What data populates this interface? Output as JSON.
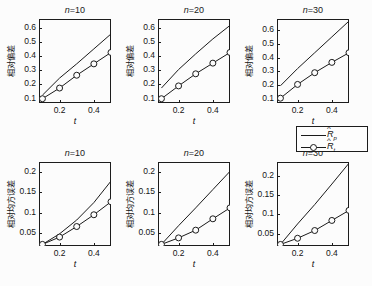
{
  "figure": {
    "background": "#fcfcfc",
    "axis_color": "#1c1c1c",
    "line_color": "#1a1a1a"
  },
  "legend": {
    "position": "below-top-right-panel",
    "entries": [
      {
        "label_base": "R",
        "label_sub": "p",
        "style": "solid-line",
        "marker": "none"
      },
      {
        "label_base": "R",
        "label_sub": "t",
        "style": "solid-line",
        "marker": "circle"
      }
    ]
  },
  "chart_data": [
    {
      "type": "line",
      "id": "panel-bias-n10",
      "title": "n=10",
      "title_prefix": "n",
      "title_value": "=10",
      "xlabel": "t",
      "ylabel": "相对偏差",
      "xlim": [
        0.08,
        0.5
      ],
      "ylim": [
        0.07,
        0.66
      ],
      "xticks": [
        0.2,
        0.4
      ],
      "xticklabels": [
        "0.2",
        "0.4"
      ],
      "yticks": [
        0.1,
        0.2,
        0.3,
        0.4,
        0.5,
        0.6
      ],
      "yticklabels": [
        "0.1",
        "0.2",
        "0.3",
        "0.4",
        "0.5",
        "0.6"
      ],
      "grid": false,
      "x": [
        0.1,
        0.2,
        0.3,
        0.4,
        0.5
      ],
      "series": [
        {
          "name": "R_p",
          "marker": "none",
          "values": [
            0.125,
            0.245,
            0.345,
            0.45,
            0.555
          ]
        },
        {
          "name": "R_t",
          "marker": "circle",
          "values": [
            0.1,
            0.175,
            0.265,
            0.345,
            0.425
          ]
        }
      ]
    },
    {
      "type": "line",
      "id": "panel-bias-n20",
      "title": "n=20",
      "title_prefix": "n",
      "title_value": "=20",
      "xlabel": "t",
      "ylabel": "相对偏差",
      "xlim": [
        0.08,
        0.5
      ],
      "ylim": [
        0.07,
        0.66
      ],
      "xticks": [
        0.2,
        0.4
      ],
      "xticklabels": [
        "0.2",
        "0.4"
      ],
      "yticks": [
        0.1,
        0.2,
        0.3,
        0.4,
        0.5,
        0.6
      ],
      "yticklabels": [
        "0.1",
        "0.2",
        "0.3",
        "0.4",
        "0.5",
        "0.6"
      ],
      "grid": false,
      "x": [
        0.1,
        0.2,
        0.3,
        0.4,
        0.5
      ],
      "series": [
        {
          "name": "R_p",
          "marker": "none",
          "values": [
            0.175,
            0.305,
            0.415,
            0.52,
            0.615
          ]
        },
        {
          "name": "R_t",
          "marker": "circle",
          "values": [
            0.1,
            0.19,
            0.275,
            0.35,
            0.425
          ]
        }
      ]
    },
    {
      "type": "line",
      "id": "panel-bias-n30",
      "title": "n=30",
      "title_prefix": "n",
      "title_value": "=30",
      "xlabel": "t",
      "ylabel": "相对偏差",
      "xlim": [
        0.08,
        0.5
      ],
      "ylim": [
        0.07,
        0.68
      ],
      "xticks": [
        0.2,
        0.4
      ],
      "xticklabels": [
        "0.2",
        "0.4"
      ],
      "yticks": [
        0.1,
        0.2,
        0.3,
        0.4,
        0.5,
        0.6
      ],
      "yticklabels": [
        "0.1",
        "0.2",
        "0.3",
        "0.4",
        "0.5",
        "0.6"
      ],
      "grid": false,
      "x": [
        0.1,
        0.2,
        0.3,
        0.4,
        0.5
      ],
      "series": [
        {
          "name": "R_p",
          "marker": "none",
          "values": [
            0.195,
            0.32,
            0.435,
            0.55,
            0.665
          ]
        },
        {
          "name": "R_t",
          "marker": "circle",
          "values": [
            0.105,
            0.205,
            0.29,
            0.365,
            0.435
          ]
        }
      ]
    },
    {
      "type": "line",
      "id": "panel-mse-n10",
      "title": "n=10",
      "title_prefix": "n",
      "title_value": "=10",
      "xlabel": "t",
      "ylabel": "相对均方误差",
      "xlim": [
        0.08,
        0.5
      ],
      "ylim": [
        0.018,
        0.225
      ],
      "xticks": [
        0.2,
        0.4
      ],
      "xticklabels": [
        "0.2",
        "0.4"
      ],
      "yticks": [
        0.05,
        0.1,
        0.15,
        0.2
      ],
      "yticklabels": [
        "0.05",
        "0.1",
        "0.15",
        "0.2"
      ],
      "grid": false,
      "x": [
        0.1,
        0.2,
        0.3,
        0.4,
        0.5
      ],
      "series": [
        {
          "name": "R_p",
          "marker": "none",
          "values": [
            0.022,
            0.048,
            0.082,
            0.125,
            0.178
          ]
        },
        {
          "name": "R_t",
          "marker": "circle",
          "values": [
            0.022,
            0.04,
            0.066,
            0.095,
            0.127
          ]
        }
      ]
    },
    {
      "type": "line",
      "id": "panel-mse-n20",
      "title": "n=20",
      "title_prefix": "n",
      "title_value": "=20",
      "xlabel": "t",
      "ylabel": "相对均方误差",
      "xlim": [
        0.08,
        0.5
      ],
      "ylim": [
        0.018,
        0.225
      ],
      "xticks": [
        0.2,
        0.4
      ],
      "xticklabels": [
        "0.2",
        "0.4"
      ],
      "yticks": [
        0.05,
        0.1,
        0.15,
        0.2
      ],
      "yticklabels": [
        "0.05",
        "0.1",
        "0.15",
        "0.2"
      ],
      "grid": false,
      "x": [
        0.1,
        0.2,
        0.3,
        0.4,
        0.5
      ],
      "series": [
        {
          "name": "R_p",
          "marker": "none",
          "values": [
            0.022,
            0.068,
            0.112,
            0.157,
            0.202
          ]
        },
        {
          "name": "R_t",
          "marker": "circle",
          "values": [
            0.022,
            0.038,
            0.057,
            0.085,
            0.112
          ]
        }
      ]
    },
    {
      "type": "line",
      "id": "panel-mse-n30",
      "title": "n=30",
      "title_prefix": "n",
      "title_value": "=30",
      "xlabel": "t",
      "ylabel": "相对均方误差",
      "xlim": [
        0.08,
        0.5
      ],
      "ylim": [
        0.018,
        0.235
      ],
      "xticks": [
        0.2,
        0.4
      ],
      "xticklabels": [
        "0.2",
        "0.4"
      ],
      "yticks": [
        0.05,
        0.1,
        0.15,
        0.2
      ],
      "yticklabels": [
        "0.05",
        "0.1",
        "0.15",
        "0.2"
      ],
      "grid": false,
      "x": [
        0.1,
        0.2,
        0.3,
        0.4,
        0.5
      ],
      "series": [
        {
          "name": "R_p",
          "marker": "none",
          "values": [
            0.022,
            0.075,
            0.125,
            0.178,
            0.232
          ]
        },
        {
          "name": "R_t",
          "marker": "circle",
          "values": [
            0.022,
            0.038,
            0.058,
            0.084,
            0.11
          ]
        }
      ]
    }
  ]
}
